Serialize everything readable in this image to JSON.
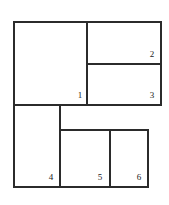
{
  "diagram": {
    "type": "rectangle-partition",
    "stroke_color": "#2b2b2b",
    "background": "#ffffff",
    "regions": [
      {
        "id": "1",
        "label": "1",
        "x": 14,
        "y": 22,
        "w": 73,
        "h": 83
      },
      {
        "id": "2",
        "label": "2",
        "x": 87,
        "y": 22,
        "w": 74,
        "h": 42
      },
      {
        "id": "3",
        "label": "3",
        "x": 87,
        "y": 64,
        "w": 74,
        "h": 41
      },
      {
        "id": "4",
        "label": "4",
        "x": 14,
        "y": 105,
        "w": 46,
        "h": 82
      },
      {
        "id": "5",
        "label": "5",
        "x": 60,
        "y": 130,
        "w": 50,
        "h": 57
      },
      {
        "id": "6",
        "label": "6",
        "x": 110,
        "y": 130,
        "w": 38,
        "h": 57
      }
    ],
    "labels": {
      "r1": "1",
      "r2": "2",
      "r3": "3",
      "r4": "4",
      "r5": "5",
      "r6": "6"
    }
  }
}
